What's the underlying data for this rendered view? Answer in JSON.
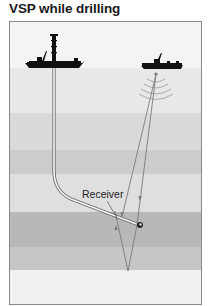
{
  "title": "VSP while drilling",
  "labels": {
    "receiver": "Receiver"
  },
  "colors": {
    "sky": "#f4f4f4",
    "sea": "#e6e6e6",
    "layer1": "#d9d9d9",
    "layer2": "#cbcbcb",
    "layer3": "#dedede",
    "layer4": "#b5b5b5",
    "layer5": "#c4c4c4",
    "layer6": "#f0f0f0",
    "border": "#8a8a8a",
    "ray": "#7a7a7a",
    "ship": "#111111",
    "pipe": "#555555"
  },
  "layers": [
    {
      "name": "sky",
      "y": 0,
      "h": 47
    },
    {
      "name": "sea",
      "y": 47,
      "h": 45
    },
    {
      "name": "layer1",
      "y": 92,
      "h": 37
    },
    {
      "name": "layer2",
      "y": 129,
      "h": 24
    },
    {
      "name": "layer3",
      "y": 153,
      "h": 38
    },
    {
      "name": "layer4",
      "y": 191,
      "h": 35
    },
    {
      "name": "layer5",
      "y": 226,
      "h": 23
    },
    {
      "name": "layer6",
      "y": 249,
      "h": 34
    }
  ]
}
